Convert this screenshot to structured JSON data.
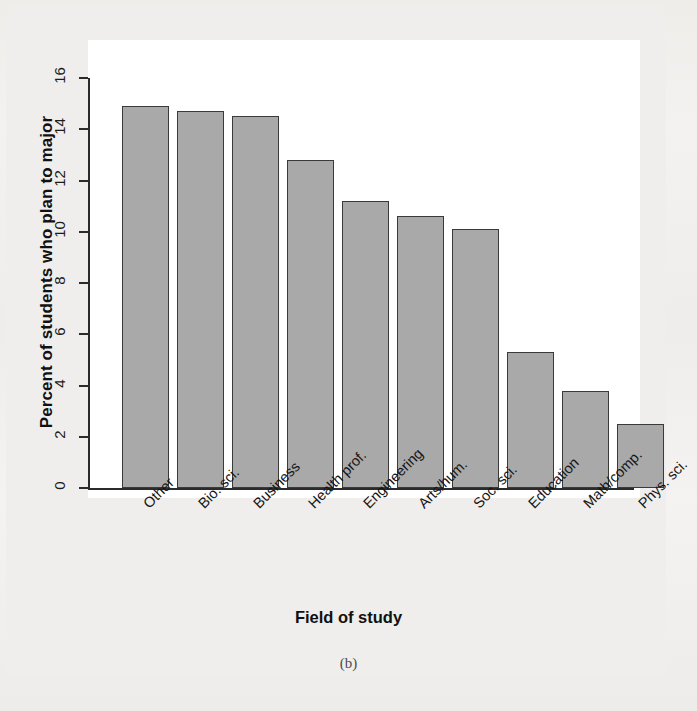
{
  "chart_data": {
    "type": "bar",
    "title": "",
    "xlabel": "Field of study",
    "ylabel": "Percent of students who plan to major",
    "panel_label": "(b)",
    "categories": [
      "Other",
      "Bio. sci.",
      "Business",
      "Health prof.",
      "Engineering",
      "Arts/hum.",
      "Soc. sci.",
      "Education",
      "Math/comp.",
      "Phys. sci."
    ],
    "values": [
      14.9,
      14.7,
      14.5,
      12.8,
      11.2,
      10.6,
      10.1,
      5.3,
      3.8,
      2.5
    ],
    "ylim": [
      0,
      16
    ],
    "yticks": [
      0,
      2,
      4,
      6,
      8,
      10,
      12,
      14,
      16
    ],
    "ytick_labels": [
      "0",
      "2",
      "4",
      "6",
      "8",
      "10",
      "12",
      "14",
      "16"
    ],
    "grid": false,
    "legend": null,
    "bar_color": "#a9a9a9",
    "bar_edge_color": "#3a3a3a",
    "axis_color": "#2b2b2b",
    "plot_background": "#ffffff",
    "page_background": "#efeeec"
  }
}
